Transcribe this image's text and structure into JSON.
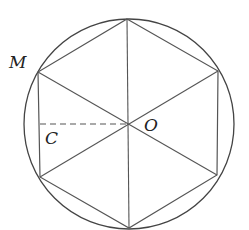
{
  "diagram": {
    "type": "inscribed-regular-hexagon",
    "circle": {
      "cx": 129,
      "cy": 124,
      "r": 105
    },
    "center": {
      "label": "O",
      "x": 128,
      "y": 124
    },
    "vertices": [
      {
        "name": "top",
        "x": 127,
        "y": 19
      },
      {
        "name": "top-right",
        "x": 218,
        "y": 71
      },
      {
        "name": "bottom-right",
        "x": 217,
        "y": 175
      },
      {
        "name": "bottom",
        "x": 129,
        "y": 228
      },
      {
        "name": "bottom-left",
        "x": 40,
        "y": 177
      },
      {
        "name": "top-left",
        "label": "M",
        "x": 38,
        "y": 72
      }
    ],
    "foot_point": {
      "label": "C",
      "x": 40,
      "y": 124
    },
    "labels": {
      "M": "M",
      "O": "O",
      "C": "C"
    },
    "colors": {
      "stroke": "#555555",
      "circle": "#444444",
      "text": "#222222"
    }
  }
}
